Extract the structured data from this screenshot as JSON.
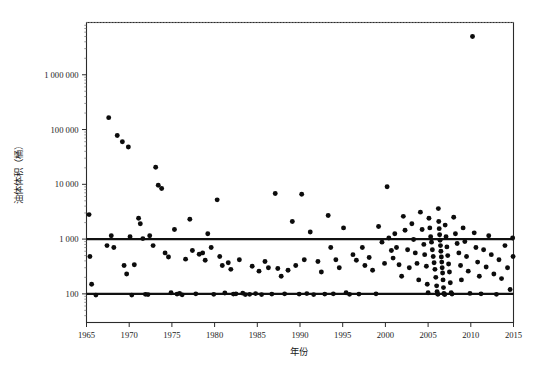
{
  "figure": {
    "background_color": "#ffffff",
    "frame_color": "#2b2b2b",
    "point_color": "#0c0c0c",
    "reference_line_color": "#111111",
    "gridline_color": "#b9b9b9"
  },
  "chart_data": {
    "type": "scatter",
    "title": "",
    "subtitle": "",
    "xlabel": "年份",
    "ylabel": "油体体积（桶）",
    "yscale": "log",
    "xscale": "linear",
    "xlim": [
      1965,
      2015
    ],
    "ylim": [
      30,
      9000000
    ],
    "grid": true,
    "legend": null,
    "legend_position": "none",
    "xticks": [
      1965,
      1970,
      1975,
      1980,
      1985,
      1990,
      1995,
      2000,
      2005,
      2010,
      2015
    ],
    "xtick_labels": [
      "1965",
      "1970",
      "1975",
      "1980",
      "1985",
      "1990",
      "1995",
      "2000",
      "2005",
      "2010",
      "2015"
    ],
    "yticks": [
      100,
      1000,
      10000,
      100000,
      1000000
    ],
    "ytick_labels": [
      "100",
      "1 000",
      "10 000",
      "100 000",
      "1 000 000"
    ],
    "annotations": [
      {
        "name": "upper-reference-line",
        "type": "hline",
        "y": 1000,
        "label": ""
      },
      {
        "name": "lower-reference-line",
        "type": "hline",
        "y": 100,
        "label": ""
      }
    ],
    "series": [
      {
        "name": "油体体积",
        "marker": "circle",
        "color": "#0c0c0c",
        "points": [
          [
            1965.3,
            2800
          ],
          [
            1965.4,
            480
          ],
          [
            1965.6,
            150
          ],
          [
            1966.1,
            95
          ],
          [
            1967.6,
            165000
          ],
          [
            1967.9,
            1150
          ],
          [
            1967.4,
            760
          ],
          [
            1968.2,
            700
          ],
          [
            1968.6,
            78000
          ],
          [
            1969.2,
            60000
          ],
          [
            1969.9,
            48000
          ],
          [
            1969.4,
            330
          ],
          [
            1969.7,
            230
          ],
          [
            1970.1,
            1100
          ],
          [
            1970.3,
            95
          ],
          [
            1970.6,
            340
          ],
          [
            1971.1,
            2400
          ],
          [
            1971.3,
            1900
          ],
          [
            1971.6,
            1020
          ],
          [
            1971.9,
            98
          ],
          [
            1972.2,
            97
          ],
          [
            1972.4,
            1150
          ],
          [
            1972.8,
            760
          ],
          [
            1973.1,
            20500
          ],
          [
            1973.4,
            9600
          ],
          [
            1973.8,
            8400
          ],
          [
            1974.2,
            560
          ],
          [
            1974.6,
            470
          ],
          [
            1974.9,
            105
          ],
          [
            1975.3,
            1500
          ],
          [
            1975.6,
            99
          ],
          [
            1975.9,
            102
          ],
          [
            1976.2,
            96
          ],
          [
            1976.6,
            430
          ],
          [
            1977.1,
            2300
          ],
          [
            1977.4,
            620
          ],
          [
            1977.8,
            100
          ],
          [
            1978.2,
            530
          ],
          [
            1978.6,
            560
          ],
          [
            1978.9,
            410
          ],
          [
            1979.2,
            1250
          ],
          [
            1979.6,
            700
          ],
          [
            1979.9,
            98
          ],
          [
            1980.3,
            5200
          ],
          [
            1980.6,
            480
          ],
          [
            1980.9,
            330
          ],
          [
            1981.2,
            104
          ],
          [
            1981.6,
            370
          ],
          [
            1981.9,
            280
          ],
          [
            1982.2,
            99
          ],
          [
            1982.5,
            100
          ],
          [
            1982.9,
            420
          ],
          [
            1983.3,
            103
          ],
          [
            1983.6,
            97
          ],
          [
            1984.1,
            98
          ],
          [
            1984.4,
            320
          ],
          [
            1984.8,
            101
          ],
          [
            1985.2,
            260
          ],
          [
            1985.5,
            97
          ],
          [
            1985.9,
            390
          ],
          [
            1986.3,
            300
          ],
          [
            1986.7,
            99
          ],
          [
            1987.1,
            6800
          ],
          [
            1987.4,
            290
          ],
          [
            1987.8,
            210
          ],
          [
            1988.2,
            100
          ],
          [
            1988.6,
            270
          ],
          [
            1989.1,
            2100
          ],
          [
            1989.5,
            330
          ],
          [
            1989.9,
            99
          ],
          [
            1990.2,
            6600
          ],
          [
            1990.5,
            420
          ],
          [
            1990.8,
            101
          ],
          [
            1991.2,
            1350
          ],
          [
            1991.6,
            97
          ],
          [
            1992.1,
            390
          ],
          [
            1992.5,
            250
          ],
          [
            1992.9,
            99
          ],
          [
            1993.3,
            2700
          ],
          [
            1993.6,
            700
          ],
          [
            1993.9,
            100
          ],
          [
            1994.2,
            420
          ],
          [
            1994.6,
            300
          ],
          [
            1995.1,
            1600
          ],
          [
            1995.4,
            105
          ],
          [
            1995.8,
            98
          ],
          [
            1996.2,
            520
          ],
          [
            1996.6,
            410
          ],
          [
            1996.9,
            99
          ],
          [
            1997.3,
            700
          ],
          [
            1997.6,
            330
          ],
          [
            1998.1,
            460
          ],
          [
            1998.5,
            270
          ],
          [
            1998.9,
            100
          ],
          [
            1999.2,
            1700
          ],
          [
            1999.6,
            880
          ],
          [
            1999.9,
            360
          ],
          [
            2000.2,
            9000
          ],
          [
            2000.4,
            1050
          ],
          [
            2000.7,
            620
          ],
          [
            2000.9,
            450
          ],
          [
            2001.1,
            1250
          ],
          [
            2001.3,
            700
          ],
          [
            2001.6,
            340
          ],
          [
            2001.9,
            210
          ],
          [
            2002.1,
            2600
          ],
          [
            2002.3,
            1450
          ],
          [
            2002.6,
            640
          ],
          [
            2002.8,
            300
          ],
          [
            2003.1,
            1900
          ],
          [
            2003.3,
            980
          ],
          [
            2003.5,
            560
          ],
          [
            2003.7,
            360
          ],
          [
            2003.9,
            180
          ],
          [
            2004.1,
            3100
          ],
          [
            2004.3,
            1500
          ],
          [
            2004.5,
            800
          ],
          [
            2004.6,
            520
          ],
          [
            2004.8,
            320
          ],
          [
            2004.9,
            150
          ],
          [
            2005.0,
            105
          ],
          [
            2005.1,
            2400
          ],
          [
            2005.2,
            1600
          ],
          [
            2005.3,
            1100
          ],
          [
            2005.4,
            880
          ],
          [
            2005.5,
            640
          ],
          [
            2005.6,
            480
          ],
          [
            2005.7,
            370
          ],
          [
            2005.8,
            280
          ],
          [
            2005.9,
            200
          ],
          [
            2006.0,
            140
          ],
          [
            2006.05,
            110
          ],
          [
            2006.1,
            100
          ],
          [
            2006.15,
            98
          ],
          [
            2006.2,
            3600
          ],
          [
            2006.25,
            2100
          ],
          [
            2006.3,
            1550
          ],
          [
            2006.35,
            1200
          ],
          [
            2006.4,
            950
          ],
          [
            2006.45,
            760
          ],
          [
            2006.5,
            600
          ],
          [
            2006.55,
            470
          ],
          [
            2006.6,
            380
          ],
          [
            2006.65,
            300
          ],
          [
            2006.7,
            240
          ],
          [
            2006.75,
            180
          ],
          [
            2006.8,
            130
          ],
          [
            2006.85,
            102
          ],
          [
            2006.9,
            99
          ],
          [
            2006.95,
            97
          ],
          [
            2007.0,
            1800
          ],
          [
            2007.1,
            1100
          ],
          [
            2007.2,
            720
          ],
          [
            2007.3,
            500
          ],
          [
            2007.4,
            350
          ],
          [
            2007.5,
            250
          ],
          [
            2007.6,
            160
          ],
          [
            2007.7,
            105
          ],
          [
            2007.8,
            99
          ],
          [
            2008.0,
            2500
          ],
          [
            2008.2,
            1250
          ],
          [
            2008.4,
            830
          ],
          [
            2008.6,
            560
          ],
          [
            2008.8,
            330
          ],
          [
            2008.9,
            180
          ],
          [
            2009.1,
            1600
          ],
          [
            2009.3,
            900
          ],
          [
            2009.5,
            480
          ],
          [
            2009.7,
            260
          ],
          [
            2009.9,
            102
          ],
          [
            2010.2,
            5000000
          ],
          [
            2010.4,
            1300
          ],
          [
            2010.6,
            700
          ],
          [
            2010.8,
            380
          ],
          [
            2011.0,
            210
          ],
          [
            2011.2,
            100
          ],
          [
            2011.5,
            640
          ],
          [
            2011.8,
            310
          ],
          [
            2012.1,
            1150
          ],
          [
            2012.4,
            520
          ],
          [
            2012.7,
            230
          ],
          [
            2013.0,
            98
          ],
          [
            2013.3,
            420
          ],
          [
            2013.6,
            190
          ],
          [
            2014.0,
            760
          ],
          [
            2014.3,
            300
          ],
          [
            2014.6,
            120
          ],
          [
            2014.9,
            1050
          ],
          [
            2014.95,
            480
          ]
        ]
      }
    ]
  }
}
